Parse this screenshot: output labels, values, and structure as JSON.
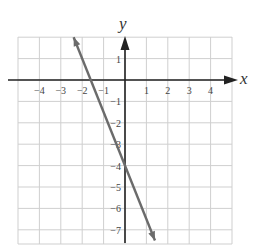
{
  "chart_data": {
    "type": "line",
    "title": "",
    "xlabel": "x",
    "ylabel": "y",
    "xlim": [
      -5,
      5
    ],
    "ylim": [
      -7.7,
      2
    ],
    "grid": true,
    "x_ticks": [
      "-4",
      "-3",
      "-2",
      "-1",
      "1",
      "2",
      "3",
      "4"
    ],
    "y_ticks": [
      "1",
      "-1",
      "-2",
      "-3",
      "-4",
      "-5",
      "-6",
      "-7"
    ],
    "series": [
      {
        "name": "line",
        "equation": "y = -2.5x - 4",
        "x": [
          -2.4,
          0,
          1.4
        ],
        "y": [
          2,
          -4,
          -7.5
        ],
        "arrows_both_ends": true,
        "color": "#6b6b6b"
      }
    ],
    "y_intercept": -4
  },
  "colors": {
    "grid": "#cfcfcf",
    "axis": "#222222",
    "line": "#6b6b6b"
  }
}
